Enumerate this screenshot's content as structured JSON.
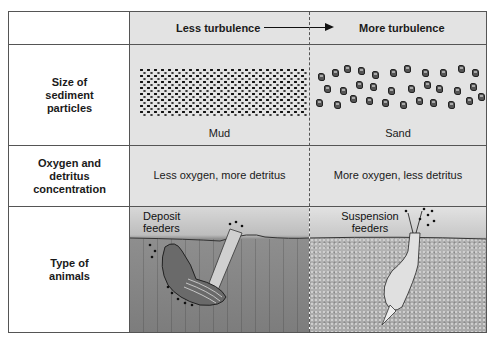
{
  "header": {
    "left": "Less turbulence",
    "right": "More turbulence",
    "arrow": "arrow-right-icon"
  },
  "rows": [
    {
      "label": "Size of sediment particles",
      "left": "Mud",
      "right": "Sand"
    },
    {
      "label": "Oxygen and detritus concentration",
      "left": "Less oxygen, more detritus",
      "right": "More oxygen, less detritus"
    },
    {
      "label": "Type of animals",
      "left": "Deposit feeders",
      "right": "Suspension feeders"
    }
  ],
  "colors": {
    "cell_shade": "#e3e3e3",
    "border": "#555555",
    "text": "#1a1a1a"
  }
}
